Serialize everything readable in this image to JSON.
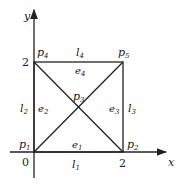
{
  "diagram": {
    "axes": {
      "x_label": "x",
      "y_label": "y",
      "origin": "0",
      "x_tick": "2",
      "y_tick": "2"
    },
    "nodes": [
      {
        "id": "p1",
        "name": "p",
        "sub": "1",
        "coord": [
          0,
          0
        ]
      },
      {
        "id": "p2",
        "name": "p",
        "sub": "2",
        "coord": [
          2,
          0
        ]
      },
      {
        "id": "p3",
        "name": "p",
        "sub": "3",
        "coord": [
          1,
          1
        ]
      },
      {
        "id": "p4",
        "name": "p",
        "sub": "4",
        "coord": [
          0,
          2
        ]
      },
      {
        "id": "p5",
        "name": "p",
        "sub": "5",
        "coord": [
          2,
          2
        ]
      }
    ],
    "boundaries": [
      {
        "name": "l",
        "sub": "1",
        "side": "bottom"
      },
      {
        "name": "l",
        "sub": "2",
        "side": "left"
      },
      {
        "name": "l",
        "sub": "3",
        "side": "right"
      },
      {
        "name": "l",
        "sub": "4",
        "side": "top"
      }
    ],
    "elements": [
      {
        "name": "e",
        "sub": "1",
        "region": "bottom triangle"
      },
      {
        "name": "e",
        "sub": "2",
        "region": "left triangle"
      },
      {
        "name": "e",
        "sub": "3",
        "region": "right triangle"
      },
      {
        "name": "e",
        "sub": "4",
        "region": "top triangle"
      }
    ]
  }
}
